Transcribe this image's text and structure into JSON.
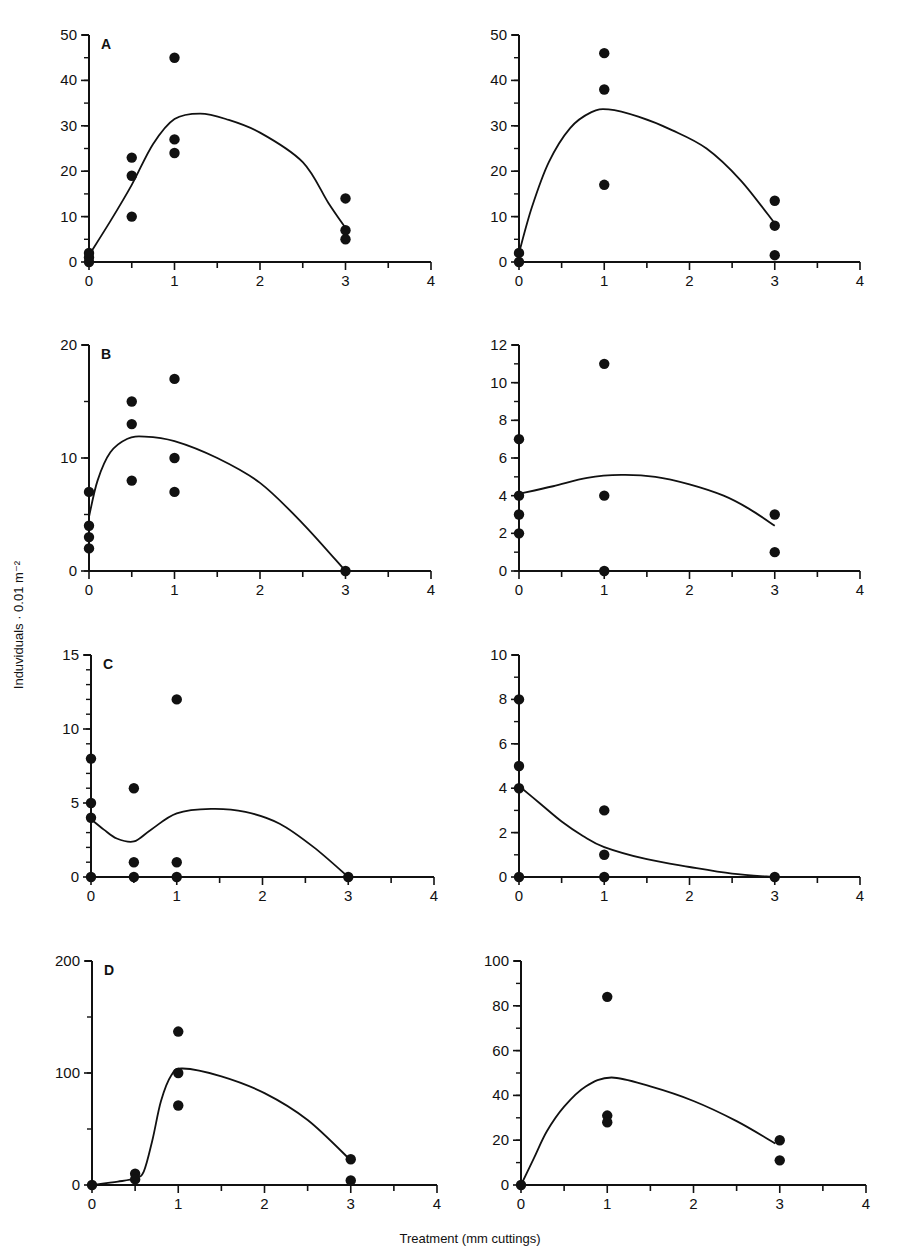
{
  "figure": {
    "y_axis_label": "Induviduals · 0.01 m⁻²",
    "x_axis_label": "Treatment (mm cuttings)"
  },
  "chart_data": [
    {
      "id": "A-left",
      "panel_label": "A",
      "type": "scatter",
      "xlim": [
        0,
        4
      ],
      "ylim": [
        0,
        50
      ],
      "xticks": [
        0,
        1,
        2,
        3,
        4
      ],
      "yticks": [
        0,
        10,
        20,
        30,
        40,
        50
      ],
      "yminor": 5,
      "box": {
        "x0": 89,
        "x1": 431,
        "y0": 262,
        "y1": 35
      },
      "points": [
        [
          0,
          0
        ],
        [
          0,
          1
        ],
        [
          0,
          2
        ],
        [
          0.5,
          23
        ],
        [
          0.5,
          19
        ],
        [
          0.5,
          10
        ],
        [
          1,
          45
        ],
        [
          1,
          27
        ],
        [
          1,
          24
        ],
        [
          3,
          14
        ],
        [
          3,
          7
        ],
        [
          3,
          5
        ]
      ],
      "curve": [
        [
          0,
          1.5
        ],
        [
          0.25,
          9
        ],
        [
          0.5,
          17
        ],
        [
          0.75,
          26
        ],
        [
          1,
          31.5
        ],
        [
          1.3,
          32.7
        ],
        [
          1.6,
          31.5
        ],
        [
          2,
          28.5
        ],
        [
          2.5,
          22
        ],
        [
          2.8,
          13
        ],
        [
          3,
          7.5
        ]
      ]
    },
    {
      "id": "A-right",
      "panel_label": "",
      "type": "scatter",
      "xlim": [
        0,
        4
      ],
      "ylim": [
        0,
        50
      ],
      "xticks": [
        0,
        1,
        2,
        3,
        4
      ],
      "yticks": [
        0,
        10,
        20,
        30,
        40,
        50
      ],
      "yminor": 5,
      "box": {
        "x0": 519,
        "x1": 860,
        "y0": 262,
        "y1": 35
      },
      "points": [
        [
          0,
          0
        ],
        [
          0,
          2
        ],
        [
          1,
          46
        ],
        [
          1,
          38
        ],
        [
          1,
          17
        ],
        [
          3,
          13.5
        ],
        [
          3,
          8
        ],
        [
          3,
          1.5
        ]
      ],
      "curve": [
        [
          0,
          2
        ],
        [
          0.15,
          12
        ],
        [
          0.35,
          22
        ],
        [
          0.6,
          29.5
        ],
        [
          0.85,
          33
        ],
        [
          1.05,
          33.6
        ],
        [
          1.4,
          32
        ],
        [
          1.8,
          29
        ],
        [
          2.2,
          25
        ],
        [
          2.6,
          18
        ],
        [
          3,
          8.5
        ]
      ]
    },
    {
      "id": "B-left",
      "panel_label": "B",
      "type": "scatter",
      "xlim": [
        0,
        4
      ],
      "ylim": [
        0,
        20
      ],
      "xticks": [
        0,
        1,
        2,
        3,
        4
      ],
      "yticks": [
        0,
        10,
        20
      ],
      "ytick_labels_show": [
        0,
        10,
        20
      ],
      "yminor": 5,
      "box": {
        "x0": 89,
        "x1": 431,
        "y0": 571,
        "y1": 345
      },
      "points": [
        [
          0,
          7
        ],
        [
          0,
          4
        ],
        [
          0,
          3
        ],
        [
          0,
          2
        ],
        [
          0.5,
          15
        ],
        [
          0.5,
          13
        ],
        [
          0.5,
          8
        ],
        [
          1,
          17
        ],
        [
          1,
          10
        ],
        [
          1,
          7
        ],
        [
          3,
          0
        ]
      ],
      "curve": [
        [
          0,
          4.8
        ],
        [
          0.1,
          8
        ],
        [
          0.25,
          10.5
        ],
        [
          0.45,
          11.7
        ],
        [
          0.65,
          11.9
        ],
        [
          1,
          11.5
        ],
        [
          1.5,
          10
        ],
        [
          2,
          7.8
        ],
        [
          2.5,
          4.2
        ],
        [
          3,
          0
        ]
      ]
    },
    {
      "id": "B-right",
      "panel_label": "",
      "type": "scatter",
      "xlim": [
        0,
        4
      ],
      "ylim": [
        0,
        12
      ],
      "xticks": [
        0,
        1,
        2,
        3,
        4
      ],
      "yticks": [
        0,
        2,
        4,
        6,
        8,
        10,
        12
      ],
      "yminor": 1,
      "box": {
        "x0": 519,
        "x1": 860,
        "y0": 571,
        "y1": 345
      },
      "points": [
        [
          0,
          7
        ],
        [
          0,
          4
        ],
        [
          0,
          3
        ],
        [
          0,
          2
        ],
        [
          1,
          11
        ],
        [
          1,
          4
        ],
        [
          1,
          0
        ],
        [
          3,
          3
        ],
        [
          3,
          1
        ]
      ],
      "curve": [
        [
          0,
          4.1
        ],
        [
          0.4,
          4.5
        ],
        [
          0.8,
          4.95
        ],
        [
          1.2,
          5.1
        ],
        [
          1.6,
          5
        ],
        [
          2,
          4.6
        ],
        [
          2.4,
          4
        ],
        [
          2.7,
          3.3
        ],
        [
          3,
          2.4
        ]
      ]
    },
    {
      "id": "C-left",
      "panel_label": "C",
      "type": "scatter",
      "xlim": [
        0,
        4
      ],
      "ylim": [
        0,
        15
      ],
      "xticks": [
        0,
        1,
        2,
        3,
        4
      ],
      "yticks": [
        0,
        5,
        10,
        15
      ],
      "yminor": 1,
      "box": {
        "x0": 91,
        "x1": 434,
        "y0": 877,
        "y1": 655
      },
      "points": [
        [
          0,
          8
        ],
        [
          0,
          5
        ],
        [
          0,
          4
        ],
        [
          0,
          0
        ],
        [
          0.5,
          6
        ],
        [
          0.5,
          1
        ],
        [
          0.5,
          0
        ],
        [
          1,
          12
        ],
        [
          1,
          1
        ],
        [
          1,
          0
        ],
        [
          3,
          0
        ]
      ],
      "curve": [
        [
          0,
          3.9
        ],
        [
          0.15,
          3.2
        ],
        [
          0.3,
          2.6
        ],
        [
          0.5,
          2.4
        ],
        [
          0.7,
          3.2
        ],
        [
          1,
          4.3
        ],
        [
          1.4,
          4.6
        ],
        [
          1.8,
          4.4
        ],
        [
          2.2,
          3.6
        ],
        [
          2.6,
          2
        ],
        [
          3,
          0
        ]
      ]
    },
    {
      "id": "C-right",
      "panel_label": "",
      "type": "scatter",
      "xlim": [
        0,
        4
      ],
      "ylim": [
        0,
        10
      ],
      "xticks": [
        0,
        1,
        2,
        3,
        4
      ],
      "yticks": [
        0,
        2,
        4,
        6,
        8,
        10
      ],
      "yminor": 1,
      "box": {
        "x0": 519,
        "x1": 860,
        "y0": 877,
        "y1": 655
      },
      "points": [
        [
          0,
          8
        ],
        [
          0,
          5
        ],
        [
          0,
          4
        ],
        [
          0,
          0
        ],
        [
          1,
          3
        ],
        [
          1,
          1
        ],
        [
          1,
          0
        ],
        [
          3,
          0
        ]
      ],
      "curve": [
        [
          0,
          4.1
        ],
        [
          0.25,
          3.3
        ],
        [
          0.5,
          2.5
        ],
        [
          0.75,
          1.85
        ],
        [
          1,
          1.35
        ],
        [
          1.5,
          0.8
        ],
        [
          2,
          0.45
        ],
        [
          2.5,
          0.15
        ],
        [
          3,
          0
        ]
      ]
    },
    {
      "id": "D-left",
      "panel_label": "D",
      "type": "scatter",
      "xlim": [
        0,
        4
      ],
      "ylim": [
        0,
        200
      ],
      "xticks": [
        0,
        1,
        2,
        3,
        4
      ],
      "yticks": [
        0,
        100,
        200
      ],
      "yminor": 50,
      "box": {
        "x0": 92,
        "x1": 437,
        "y0": 1185,
        "y1": 961
      },
      "points": [
        [
          0,
          0
        ],
        [
          0.5,
          10
        ],
        [
          0.5,
          5
        ],
        [
          1,
          137
        ],
        [
          1,
          100
        ],
        [
          1,
          71
        ],
        [
          3,
          23
        ],
        [
          3,
          4
        ]
      ],
      "curve": [
        [
          0,
          0
        ],
        [
          0.3,
          3
        ],
        [
          0.5,
          6
        ],
        [
          0.6,
          12
        ],
        [
          0.7,
          40
        ],
        [
          0.8,
          75
        ],
        [
          0.92,
          98
        ],
        [
          1.05,
          104
        ],
        [
          1.5,
          97
        ],
        [
          2,
          82
        ],
        [
          2.5,
          58
        ],
        [
          3,
          22
        ]
      ]
    },
    {
      "id": "D-right",
      "panel_label": "",
      "type": "scatter",
      "xlim": [
        0,
        4
      ],
      "ylim": [
        0,
        100
      ],
      "xticks": [
        0,
        1,
        2,
        3,
        4
      ],
      "yticks": [
        0,
        20,
        40,
        60,
        80,
        100
      ],
      "yminor": 10,
      "box": {
        "x0": 521,
        "x1": 866,
        "y0": 1185,
        "y1": 961
      },
      "points": [
        [
          0,
          0
        ],
        [
          1,
          84
        ],
        [
          1,
          31
        ],
        [
          1,
          28
        ],
        [
          3,
          20
        ],
        [
          3,
          11
        ]
      ],
      "curve": [
        [
          0,
          0
        ],
        [
          0.15,
          12
        ],
        [
          0.3,
          24
        ],
        [
          0.5,
          35
        ],
        [
          0.75,
          44
        ],
        [
          1.05,
          48
        ],
        [
          1.5,
          44
        ],
        [
          2,
          37.5
        ],
        [
          2.5,
          28.5
        ],
        [
          2.95,
          18.5
        ]
      ]
    }
  ]
}
